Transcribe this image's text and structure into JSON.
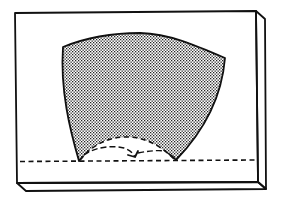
{
  "diagram": {
    "type": "illustration",
    "colors": {
      "background": "#ffffff",
      "line": "#111111",
      "stipple_fill": "#9a9a9a"
    },
    "slab": {
      "front_face": [
        [
          15,
          13
        ],
        [
          256,
          11
        ],
        [
          258,
          182
        ],
        [
          17,
          183
        ]
      ],
      "depth_offset": [
        9,
        8
      ]
    },
    "stippled_region": {
      "label": "",
      "pattern": "dot-stipple"
    },
    "dashed_baseline": {
      "y": 161,
      "x_start": 20,
      "x_end": 255
    },
    "dashed_arch": {
      "start": [
        80,
        160
      ],
      "peak": [
        125,
        137
      ],
      "end": [
        173,
        158
      ]
    },
    "inner_arrow_arc": {
      "start": [
        84,
        156
      ],
      "end": [
        166,
        151
      ],
      "arrowhead": [
        135,
        157
      ]
    }
  }
}
